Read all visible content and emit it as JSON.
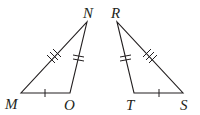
{
  "figure": {
    "triangles": [
      {
        "name": "MNO",
        "vertices": [
          {
            "label": "M",
            "x": 21,
            "y": 93
          },
          {
            "label": "O",
            "x": 70,
            "y": 93
          },
          {
            "label": "N",
            "x": 87,
            "y": 22
          }
        ],
        "sides": [
          {
            "side": "MN",
            "ticks": 3
          },
          {
            "side": "NO",
            "ticks": 2
          },
          {
            "side": "MO",
            "ticks": 1
          }
        ]
      },
      {
        "name": "RST",
        "vertices": [
          {
            "label": "R",
            "x": 117,
            "y": 22
          },
          {
            "label": "T",
            "x": 134,
            "y": 93
          },
          {
            "label": "S",
            "x": 183,
            "y": 93
          }
        ],
        "sides": [
          {
            "side": "RS",
            "ticks": 3
          },
          {
            "side": "RT",
            "ticks": 2
          },
          {
            "side": "TS",
            "ticks": 1
          }
        ]
      }
    ],
    "labels": {
      "M": "M",
      "O": "O",
      "N": "N",
      "R": "R",
      "T": "T",
      "S": "S"
    },
    "line_color": "#231f20"
  }
}
